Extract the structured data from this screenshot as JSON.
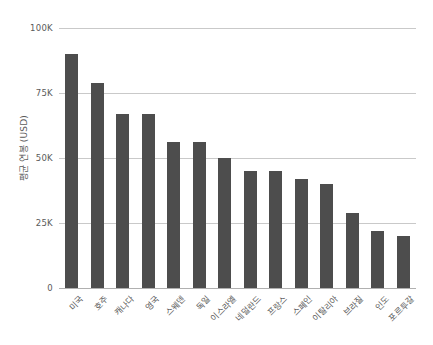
{
  "chart_data": {
    "type": "bar",
    "title": "",
    "xlabel": "",
    "ylabel": "평균 연봉 (USD)",
    "categories": [
      "미국",
      "호주",
      "캐나다",
      "영국",
      "스웨덴",
      "독일",
      "이스라엘",
      "네덜란드",
      "프랑스",
      "스페인",
      "이탈리아",
      "브라질",
      "인도",
      "포르투갈"
    ],
    "values": [
      90000,
      79000,
      67000,
      67000,
      56000,
      56000,
      50000,
      45000,
      45000,
      42000,
      40000,
      29000,
      22000,
      20000
    ],
    "ylim": [
      0,
      100000
    ],
    "ytick_values": [
      0,
      25000,
      50000,
      75000,
      100000
    ],
    "ytick_labels": [
      "0",
      "25K",
      "50K",
      "75K",
      "100K"
    ],
    "grid": true,
    "legend": null,
    "bar_color": "#4d4d4d",
    "gridline_color": "#c9c9c9",
    "background_color": "#ffffff",
    "text_color": "#5a5a5a"
  }
}
